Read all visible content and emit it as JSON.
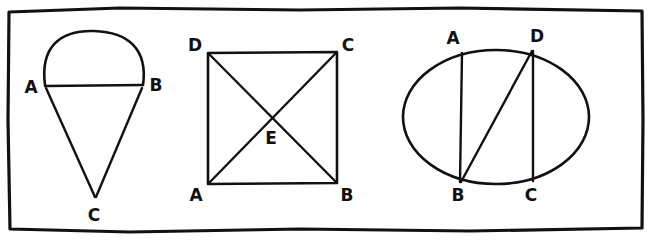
{
  "image": {
    "title": "Hand-drawn geometry figures",
    "description": "Three hand-drawn geometric figures inside a hand-drawn rectangular border",
    "width": 652,
    "height": 245,
    "background_color": "#ffffff",
    "ink_color": "#111111"
  },
  "border": {
    "name": "hand-drawn-rectangle-border",
    "path": "M 9 12 L 120 8 L 300 10 L 460 8 L 642 11 L 643 120 L 642 228 L 470 231 L 300 229 L 130 232 L 10 229 L 8 120 Z"
  },
  "figures": [
    {
      "id": "figure-1",
      "name": "arc-and-triangle",
      "description": "Major arc from A to B with chord AB, and triangle A-B-C below converging at apex C",
      "labels": [
        {
          "text": "A",
          "x": 31,
          "y": 88
        },
        {
          "text": "B",
          "x": 156,
          "y": 86
        },
        {
          "text": "C",
          "x": 94,
          "y": 216
        }
      ],
      "points": {
        "A": {
          "x": 45,
          "y": 85
        },
        "B": {
          "x": 143,
          "y": 85
        },
        "C": {
          "x": 95,
          "y": 197
        }
      },
      "strokes": [
        {
          "name": "arc-a-to-b",
          "path": "M 45 85 C 40 47 60 30 94 31 C 128 32 148 49 143 85"
        },
        {
          "name": "chord-a-b",
          "path": "M 45 86 L 143 85"
        },
        {
          "name": "side-a-c",
          "path": "M 46 88 L 95 197"
        },
        {
          "name": "side-b-c",
          "path": "M 142 88 L 96 197"
        }
      ]
    },
    {
      "id": "figure-2",
      "name": "square-with-diagonals",
      "description": "Square D-C-B-A with both diagonals meeting at centre point E",
      "labels": [
        {
          "text": "D",
          "x": 195,
          "y": 46
        },
        {
          "text": "C",
          "x": 348,
          "y": 46
        },
        {
          "text": "A",
          "x": 196,
          "y": 196
        },
        {
          "text": "B",
          "x": 347,
          "y": 196
        },
        {
          "text": "E",
          "x": 271,
          "y": 139
        }
      ],
      "points": {
        "D": {
          "x": 208,
          "y": 53
        },
        "C": {
          "x": 337,
          "y": 52
        },
        "A": {
          "x": 208,
          "y": 184
        },
        "B": {
          "x": 337,
          "y": 183
        },
        "E": {
          "x": 272,
          "y": 118
        }
      },
      "strokes": [
        {
          "name": "square-outline",
          "path": "M 208 53 L 337 52 L 337 183 L 208 184 Z"
        },
        {
          "name": "diagonal-d-b",
          "path": "M 209 54 L 336 182"
        },
        {
          "name": "diagonal-a-c",
          "path": "M 209 183 L 336 53"
        }
      ]
    },
    {
      "id": "figure-3",
      "name": "ellipse-with-chords",
      "description": "Ellipse with chord A-B, chord D-C and diagonal chord B-D",
      "labels": [
        {
          "text": "A",
          "x": 453,
          "y": 39
        },
        {
          "text": "D",
          "x": 537,
          "y": 37
        },
        {
          "text": "B",
          "x": 458,
          "y": 196
        },
        {
          "text": "C",
          "x": 531,
          "y": 196
        }
      ],
      "points": {
        "A": {
          "x": 462,
          "y": 52
        },
        "D": {
          "x": 533,
          "y": 50
        },
        "B": {
          "x": 461,
          "y": 182
        },
        "C": {
          "x": 533,
          "y": 181
        }
      },
      "ellipse": {
        "cx": 496,
        "cy": 117,
        "rx": 93,
        "ry": 67
      },
      "strokes": [
        {
          "name": "chord-a-b",
          "path": "M 462 53 L 460 182"
        },
        {
          "name": "chord-d-c",
          "path": "M 533 51 L 533 181"
        },
        {
          "name": "chord-b-d",
          "path": "M 461 182 L 532 51"
        }
      ]
    }
  ]
}
